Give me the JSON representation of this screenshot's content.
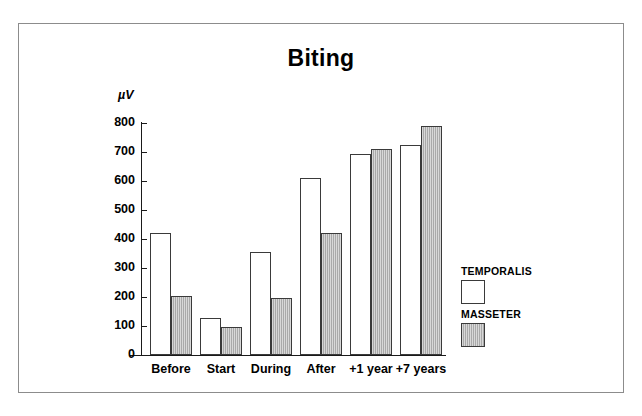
{
  "chart_data": {
    "type": "bar",
    "title": "Biting",
    "xlabel": "",
    "ylabel": "µV",
    "ylim": [
      0,
      800
    ],
    "yticks": [
      0,
      100,
      200,
      300,
      400,
      500,
      600,
      700,
      800
    ],
    "ytick_labels": [
      "0",
      "100",
      "200",
      "300",
      "400",
      "500",
      "600",
      "700",
      "800"
    ],
    "grid": false,
    "legend_position": "right",
    "categories": [
      "Before",
      "Start",
      "During",
      "After",
      "+1 year",
      "+7 years"
    ],
    "series": [
      {
        "name": "TEMPORALIS",
        "fill": "white",
        "color": "#ffffff",
        "values": [
          420,
          128,
          355,
          610,
          693,
          723
        ]
      },
      {
        "name": "MASSETER",
        "fill": "gray-vertical-hatch",
        "color": "#a9a9a9",
        "values": [
          203,
          97,
          197,
          420,
          712,
          790
        ]
      }
    ]
  },
  "legend": {
    "entries": [
      {
        "label": "TEMPORALIS"
      },
      {
        "label": "MASSETER"
      }
    ]
  }
}
